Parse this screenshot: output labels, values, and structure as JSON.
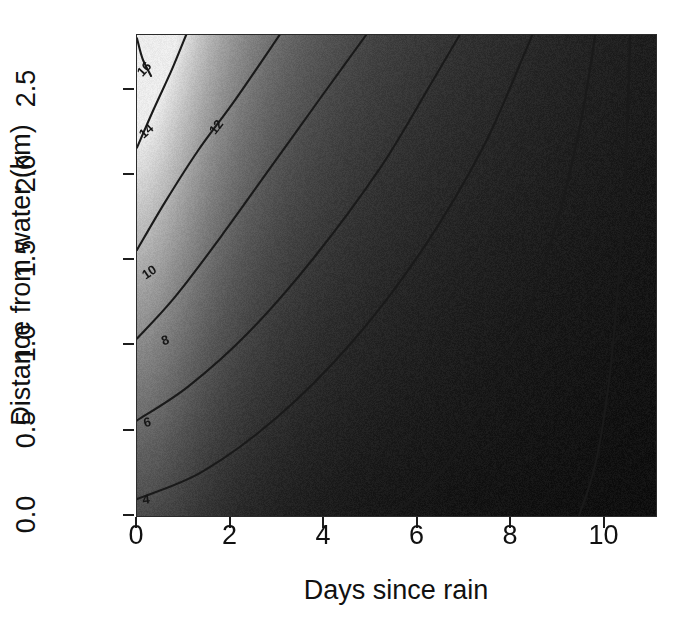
{
  "figure": {
    "width": 681,
    "height": 639,
    "background_color": "#ffffff",
    "panel_border_color": "#2b2b2b"
  },
  "chart_data": {
    "type": "heatmap",
    "subtype": "filled-contour",
    "title": "",
    "subtitle": "",
    "xlabel": "Days since rain",
    "ylabel": "Distance from water (km)",
    "xlim": [
      0,
      11.1
    ],
    "ylim": [
      0,
      2.82
    ],
    "xticks": [
      0,
      2,
      4,
      6,
      8,
      10
    ],
    "xticklabels": [
      "0",
      "2",
      "4",
      "6",
      "8",
      "10"
    ],
    "yticks": [
      0.0,
      0.5,
      1.0,
      1.5,
      2.0,
      2.5
    ],
    "yticklabels": [
      "0.0",
      "0.5",
      "1.0",
      "1.5",
      "2.0",
      "2.5"
    ],
    "grid": false,
    "legend": null,
    "colorbar": false,
    "colormap": "grayscale",
    "colormap_low_color": "#0a0a0a",
    "colormap_high_color": "#ececec",
    "zlabel": "",
    "z_high_corner": "top-left",
    "z_low_corner": "bottom-right",
    "contour_levels": [
      4,
      6,
      8,
      10,
      12,
      14,
      16
    ],
    "contour_labels": [
      "4",
      "6",
      "8",
      "10",
      "12",
      "14",
      "16"
    ],
    "contour_line_color": "#1a1a1a",
    "unlabeled_contour_levels": [
      2,
      0
    ],
    "annotations": [
      {
        "text": "16",
        "x_data": 0.15,
        "y_data": 2.62,
        "rotation": -47
      },
      {
        "text": "14",
        "x_data": 0.2,
        "y_data": 2.26,
        "rotation": -42
      },
      {
        "text": "12",
        "x_data": 1.7,
        "y_data": 2.28,
        "rotation": -52
      },
      {
        "text": "10",
        "x_data": 0.25,
        "y_data": 1.43,
        "rotation": -34
      },
      {
        "text": "8",
        "x_data": 0.6,
        "y_data": 1.03,
        "rotation": -20
      },
      {
        "text": "6",
        "x_data": 0.22,
        "y_data": 0.55,
        "rotation": -14
      },
      {
        "text": "4",
        "x_data": 0.2,
        "y_data": 0.1,
        "rotation": -7
      }
    ],
    "surface_model": {
      "description": "Monotone decreasing in days-since-rain, monotone increasing in distance-from-water; contours are hyperbola-like arcs opening toward the lower-left.",
      "z_max_approx": 18,
      "z_min_approx": 0
    },
    "contour_points": [
      {
        "level": 16,
        "points": [
          [
            0.0,
            2.8
          ],
          [
            0.12,
            2.68
          ],
          [
            0.3,
            2.58
          ]
        ]
      },
      {
        "level": 14,
        "points": [
          [
            0.0,
            2.16
          ],
          [
            0.35,
            2.38
          ],
          [
            0.75,
            2.62
          ],
          [
            1.05,
            2.82
          ]
        ]
      },
      {
        "level": 12,
        "points": [
          [
            0.0,
            1.56
          ],
          [
            0.6,
            1.84
          ],
          [
            1.3,
            2.14
          ],
          [
            2.1,
            2.44
          ],
          [
            3.05,
            2.82
          ]
        ]
      },
      {
        "level": 10,
        "points": [
          [
            0.0,
            1.04
          ],
          [
            0.8,
            1.28
          ],
          [
            1.8,
            1.64
          ],
          [
            2.9,
            2.06
          ],
          [
            4.0,
            2.48
          ],
          [
            4.9,
            2.82
          ]
        ]
      },
      {
        "level": 8,
        "points": [
          [
            0.0,
            0.56
          ],
          [
            1.1,
            0.76
          ],
          [
            2.4,
            1.08
          ],
          [
            3.8,
            1.52
          ],
          [
            5.2,
            2.04
          ],
          [
            6.3,
            2.54
          ],
          [
            6.9,
            2.82
          ]
        ]
      },
      {
        "level": 6,
        "points": [
          [
            0.0,
            0.1
          ],
          [
            1.4,
            0.26
          ],
          [
            3.0,
            0.58
          ],
          [
            4.6,
            1.02
          ],
          [
            6.1,
            1.56
          ],
          [
            7.4,
            2.16
          ],
          [
            8.3,
            2.72
          ],
          [
            8.45,
            2.82
          ]
        ]
      },
      {
        "level": 4,
        "points": [
          [
            5.4,
            0.0
          ],
          [
            6.4,
            0.22
          ],
          [
            7.4,
            0.64
          ],
          [
            8.3,
            1.16
          ],
          [
            9.0,
            1.74
          ],
          [
            9.5,
            2.32
          ],
          [
            9.8,
            2.82
          ]
        ]
      },
      {
        "level": 2,
        "points": [
          [
            9.45,
            0.0
          ],
          [
            9.8,
            0.3
          ],
          [
            10.1,
            0.8
          ],
          [
            10.3,
            1.4
          ],
          [
            10.45,
            2.05
          ],
          [
            10.55,
            2.82
          ]
        ]
      }
    ]
  },
  "axes": {
    "x_title": "Days since rain",
    "y_title": "Distance from water (km)"
  }
}
